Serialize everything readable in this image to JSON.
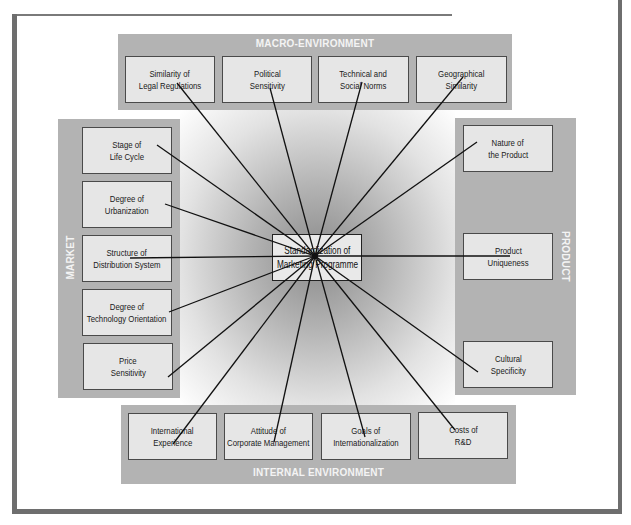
{
  "diagram": {
    "title": "Standardization of Marketing Programme",
    "hub": {
      "x": 315,
      "y": 256
    },
    "center_box": {
      "line1": "Standardization of",
      "line2": "Marketing Programme"
    },
    "colors": {
      "panel": "#b3b3b3",
      "box": "#e6e6e6",
      "box_border": "#4a4a4a",
      "line": "#111111",
      "panel_title": "#f4f4f4",
      "frame": "#6e6e6e"
    },
    "panels": {
      "macro": {
        "title": "MACRO-ENVIRONMENT",
        "items": [
          {
            "line1": "Similarity of",
            "line2": "Legal Regulations",
            "anchor": {
              "x": 177,
              "y": 83
            }
          },
          {
            "line1": "Political",
            "line2": "Sensitivity",
            "anchor": {
              "x": 270,
              "y": 88
            }
          },
          {
            "line1": "Technical and",
            "line2": "Social Norms",
            "anchor": {
              "x": 362,
              "y": 82
            }
          },
          {
            "line1": "Geographical",
            "line2": "Similarity",
            "anchor": {
              "x": 463,
              "y": 77
            }
          }
        ]
      },
      "market": {
        "title": "MARKET",
        "items": [
          {
            "line1": "Stage of",
            "line2": "Life Cycle",
            "anchor": {
              "x": 157,
              "y": 145
            }
          },
          {
            "line1": "Degree of",
            "line2": "Urbanization",
            "anchor": {
              "x": 165,
              "y": 204
            }
          },
          {
            "line1": "Structure of",
            "line2": "Distribution System",
            "anchor": {
              "x": 130,
              "y": 258
            }
          },
          {
            "line1": "Degree of",
            "line2": "Technology Orientation",
            "anchor": {
              "x": 169,
              "y": 312
            }
          },
          {
            "line1": "Price",
            "line2": "Sensitivity",
            "anchor": {
              "x": 168,
              "y": 377
            }
          }
        ]
      },
      "product": {
        "title": "PRODUCT",
        "items": [
          {
            "line1": "Nature of",
            "line2": "the Product",
            "anchor": {
              "x": 477,
              "y": 142
            }
          },
          {
            "line1": "Product",
            "line2": "Uniqueness",
            "anchor": {
              "x": 510,
              "y": 256
            }
          },
          {
            "line1": "Cultural",
            "line2": "Specificity",
            "anchor": {
              "x": 478,
              "y": 372
            }
          }
        ]
      },
      "internal": {
        "title": "INTERNAL ENVIRONMENT",
        "items": [
          {
            "line1": "International",
            "line2": "Experience",
            "anchor": {
              "x": 173,
              "y": 444
            }
          },
          {
            "line1": "Attitude of",
            "line2": "Corporate Management",
            "anchor": {
              "x": 274,
              "y": 442
            }
          },
          {
            "line1": "Goals of",
            "line2": "Internationalization",
            "anchor": {
              "x": 365,
              "y": 437
            }
          },
          {
            "line1": "Costs of",
            "line2": "R&D",
            "anchor": {
              "x": 455,
              "y": 430
            }
          }
        ]
      }
    }
  }
}
